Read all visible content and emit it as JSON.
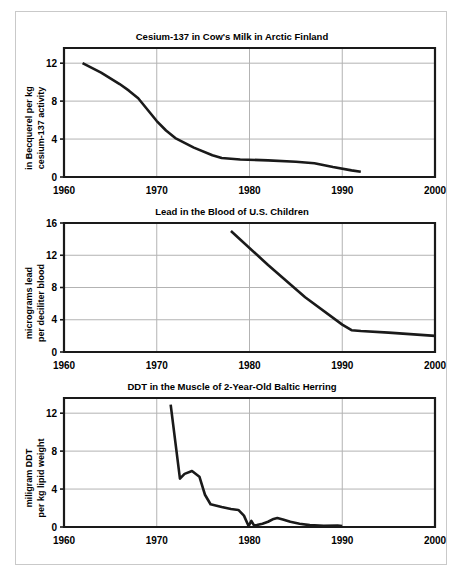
{
  "figure": {
    "background_color": "#ffffff",
    "frame_color": "#c9c9c9",
    "line_color": "#1a1a1a",
    "grid_color": "#b3b3b3",
    "footer_note": ""
  },
  "charts": [
    {
      "id": "cesium",
      "title": "Cesium-137 in Cow's Milk in Arctic Finland",
      "ylabel_line1": "in Becquerel per kg",
      "ylabel_line2": "cesium-137 activity",
      "xlabel": "",
      "xticks": [
        1960,
        1970,
        1980,
        1990,
        2000
      ],
      "yticks": [
        0,
        4,
        8,
        12
      ],
      "xlim": [
        1960,
        2000
      ],
      "ylim": [
        0,
        13.6
      ],
      "grid": true
    },
    {
      "id": "lead",
      "title": "Lead in the Blood of U.S. Children",
      "ylabel_line1": "micrograms lead",
      "ylabel_line2": "per deciliter blood",
      "xlabel": "",
      "xticks": [
        1960,
        1970,
        1980,
        1990,
        2000
      ],
      "yticks": [
        0,
        4,
        8,
        12,
        16
      ],
      "xlim": [
        1960,
        2000
      ],
      "ylim": [
        0,
        16
      ],
      "grid": true
    },
    {
      "id": "ddt",
      "title": "DDT in the Muscle of 2-Year-Old Baltic Herring",
      "ylabel_line1": "miligram DDT",
      "ylabel_line2": "per kg lipid weight",
      "xlabel": "",
      "xticks": [
        1960,
        1970,
        1980,
        1990,
        2000
      ],
      "yticks": [
        0,
        4,
        8,
        12
      ],
      "xlim": [
        1960,
        2000
      ],
      "ylim": [
        0,
        13.6
      ],
      "grid": true
    }
  ],
  "chart_data": [
    {
      "type": "line",
      "title": "Cesium-137 in Cow's Milk in Arctic Finland",
      "xlabel": "",
      "ylabel": "in Becquerel per kg cesium-137 activity",
      "xlim": [
        1960,
        2000
      ],
      "ylim": [
        0,
        13.6
      ],
      "grid": true,
      "legend": "none",
      "series": [
        {
          "name": "Cesium-137 activity",
          "x": [
            1962,
            1964,
            1966,
            1967,
            1968,
            1970,
            1971,
            1972,
            1974,
            1976,
            1977,
            1979,
            1982,
            1985,
            1987,
            1989,
            1991,
            1992
          ],
          "values": [
            12.0,
            11.0,
            9.8,
            9.1,
            8.3,
            5.9,
            4.9,
            4.1,
            3.1,
            2.3,
            2.0,
            1.85,
            1.75,
            1.6,
            1.45,
            1.05,
            0.7,
            0.55
          ]
        }
      ]
    },
    {
      "type": "line",
      "title": "Lead in the Blood of U.S. Children",
      "xlabel": "",
      "ylabel": "micrograms lead per deciliter blood",
      "xlim": [
        1960,
        2000
      ],
      "ylim": [
        0,
        16
      ],
      "grid": true,
      "legend": "none",
      "series": [
        {
          "name": "Blood lead level",
          "x": [
            1978,
            1982,
            1986,
            1990,
            1991,
            1992,
            1995,
            2000
          ],
          "values": [
            15.0,
            10.8,
            6.8,
            3.4,
            2.7,
            2.6,
            2.4,
            2.0
          ]
        }
      ]
    },
    {
      "type": "line",
      "title": "DDT in the Muscle of 2-Year-Old Baltic Herring",
      "xlabel": "",
      "ylabel": "miligram DDT per kg lipid weight",
      "xlim": [
        1960,
        2000
      ],
      "ylim": [
        0,
        13.6
      ],
      "grid": true,
      "legend": "none",
      "series": [
        {
          "name": "DDT concentration",
          "x": [
            1971.5,
            1972.5,
            1973.0,
            1973.8,
            1974.6,
            1975.2,
            1975.8,
            1977.0,
            1978.0,
            1978.8,
            1979.4,
            1979.9,
            1980.2,
            1980.5,
            1980.8,
            1981.4,
            1982.0,
            1982.6,
            1983.0,
            1983.6,
            1984.4,
            1985.4,
            1986.5,
            1988.0,
            1989.5,
            1990.0
          ],
          "values": [
            12.9,
            5.1,
            5.6,
            5.9,
            5.3,
            3.4,
            2.4,
            2.1,
            1.9,
            1.8,
            1.2,
            0.1,
            0.65,
            0.15,
            0.2,
            0.35,
            0.55,
            0.85,
            0.95,
            0.8,
            0.55,
            0.35,
            0.2,
            0.12,
            0.15,
            0.1
          ]
        }
      ]
    }
  ]
}
